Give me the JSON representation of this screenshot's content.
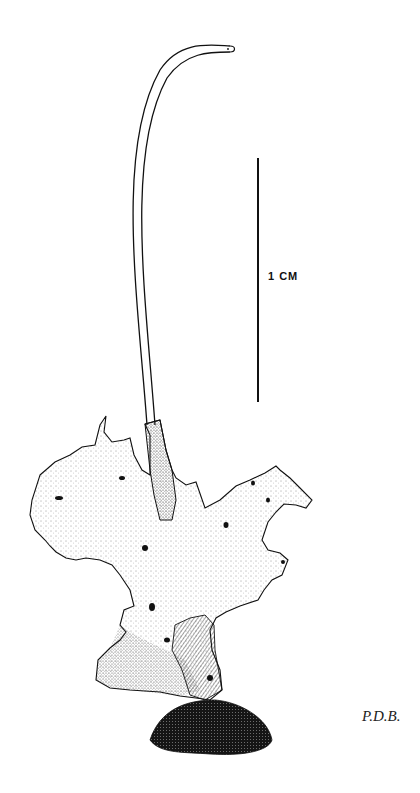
{
  "figure": {
    "type": "scientific specimen illustration",
    "scale_bar": {
      "label": "1 CM"
    },
    "signature": "P.D.B.",
    "colors": {
      "ink": "#111111",
      "paper": "#ffffff"
    }
  }
}
